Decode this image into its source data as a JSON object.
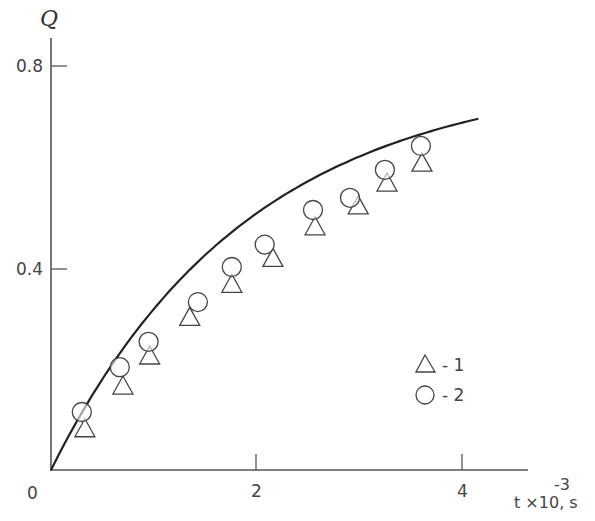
{
  "chart_data": {
    "type": "scatter",
    "title": "",
    "xlabel": "t ×10, s",
    "xlabel_exponent": "-3",
    "ylabel": "Q",
    "xlim": [
      0,
      4.6
    ],
    "ylim": [
      0,
      0.86
    ],
    "x_ticks": [
      0,
      2,
      4
    ],
    "x_tick_labels": [
      "0",
      "2",
      "4"
    ],
    "y_ticks": [
      0.4,
      0.8
    ],
    "y_tick_labels": [
      "0.4",
      "0.8"
    ],
    "grid": false,
    "legend_position": "lower right",
    "legend": [
      {
        "marker": "triangle",
        "label": "- 1"
      },
      {
        "marker": "circle",
        "label": "- 2"
      }
    ],
    "series": [
      {
        "name": "1",
        "marker": "triangle",
        "x": [
          0.33,
          0.7,
          0.96,
          1.35,
          1.76,
          2.16,
          2.57,
          2.99,
          3.27,
          3.61
        ],
        "y": [
          0.083,
          0.167,
          0.226,
          0.302,
          0.367,
          0.418,
          0.48,
          0.521,
          0.566,
          0.605
        ]
      },
      {
        "name": "2",
        "marker": "circle",
        "x": [
          0.3,
          0.67,
          0.95,
          1.43,
          1.76,
          2.08,
          2.55,
          2.91,
          3.25,
          3.6
        ],
        "y": [
          0.114,
          0.202,
          0.252,
          0.33,
          0.399,
          0.443,
          0.511,
          0.535,
          0.59,
          0.637
        ]
      },
      {
        "name": "fit",
        "marker": "line",
        "x": [
          0,
          0.5,
          1.0,
          1.5,
          2.0,
          2.5,
          3.0,
          3.5,
          4.0,
          4.16
        ],
        "y": [
          0,
          0.145,
          0.265,
          0.365,
          0.445,
          0.51,
          0.565,
          0.61,
          0.655,
          0.668
        ]
      }
    ]
  },
  "axes": {
    "origin_label": "0",
    "x_label_main": "t ×10,  s",
    "x_label_exp": "-3",
    "y_label": "Q"
  },
  "legend": {
    "item1_label": "- 1",
    "item2_label": "- 2"
  }
}
